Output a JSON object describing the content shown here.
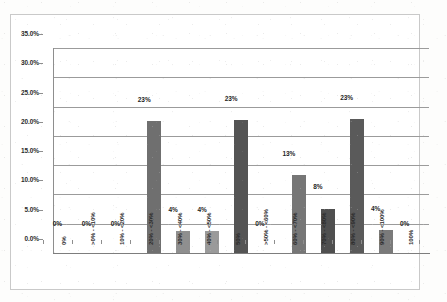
{
  "chart_data": {
    "type": "bar",
    "title": "",
    "subtitle": "",
    "xlabel": "",
    "ylabel": "",
    "ylim": [
      0,
      35
    ],
    "ytick_labels": [
      "0.0%",
      "5.0%",
      "10.0%",
      "15.0%",
      "20.0%",
      "25.0%",
      "30.0%",
      "35.0%"
    ],
    "ytick_values": [
      0,
      5,
      10,
      15,
      20,
      25,
      30,
      35
    ],
    "grid": true,
    "legend": false,
    "legend_position": "none",
    "categories": [
      "0%",
      ">0% - <10%",
      "10% - <20%",
      "20% - <30%",
      "30% - <40%",
      "40% - <50%",
      "50%",
      ">50% - <60%",
      "60% - <70%",
      "70% - <80%",
      "80% - <90%",
      "90% - <100%",
      "100%"
    ],
    "values": [
      0,
      0,
      0,
      22.6,
      3.7,
      3.7,
      22.7,
      0,
      13.3,
      7.6,
      22.8,
      3.9,
      0
    ],
    "data_labels": [
      "0%",
      "0%",
      "0%",
      "23%",
      "4%",
      "4%",
      "23%",
      "0%",
      "13%",
      "8%",
      "23%",
      "4%",
      "0%"
    ],
    "bar_colors": [
      "#7e7e7e",
      "#7e7e7e",
      "#7e7e7e",
      "#6f6f6f",
      "#8f8f8f",
      "#9a9a9a",
      "#545454",
      "#7e7e7e",
      "#767676",
      "#4f4f4f",
      "#5a5a5a",
      "#7a7a7a",
      "#7e7e7e"
    ]
  },
  "colors": {
    "gridline": "#9b9b9b",
    "axis": "#8e8e8e",
    "text": "#2b2b2b",
    "frame": "#c9c9c9",
    "background": "#ffffff"
  }
}
